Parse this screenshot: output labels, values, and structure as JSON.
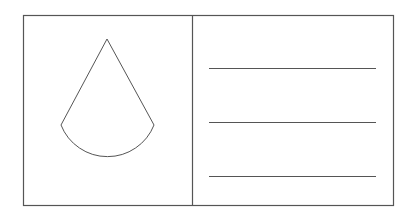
{
  "diagram": {
    "stroke_color": "#555555",
    "background": "#ffffff",
    "left_panel": {
      "icon": "water-drop-icon"
    },
    "right_panel": {
      "line_count": 3
    }
  }
}
